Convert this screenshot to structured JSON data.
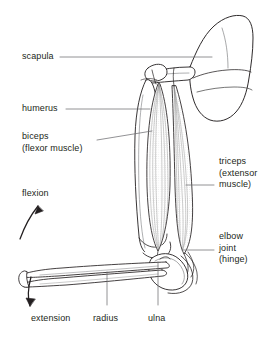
{
  "figure": {
    "background": "#ffffff",
    "ink": "#231f20",
    "leader_color": "#6d6e71"
  },
  "labels": {
    "scapula": {
      "text": "scapula",
      "x": 22,
      "y": 53
    },
    "humerus": {
      "text": "humerus",
      "x": 22,
      "y": 105
    },
    "biceps": {
      "line1": "biceps",
      "line2": "(flexor muscle)",
      "x": 22,
      "y": 135
    },
    "flexion": {
      "text": "flexion",
      "x": 22,
      "y": 191
    },
    "extension": {
      "text": "extension",
      "x": 31,
      "y": 316
    },
    "radius": {
      "text": "radius",
      "x": 94,
      "y": 316
    },
    "ulna": {
      "text": "ulna",
      "x": 149,
      "y": 316
    },
    "triceps": {
      "line1": "triceps",
      "line2": "(extensor",
      "line3": "muscle)",
      "x": 218,
      "y": 158
    },
    "elbow": {
      "line1": "elbow",
      "line2": "joint",
      "line3": "(hinge)",
      "x": 218,
      "y": 233
    }
  },
  "structures": [
    {
      "name": "scapula",
      "kind": "bone"
    },
    {
      "name": "humerus",
      "kind": "bone"
    },
    {
      "name": "radius",
      "kind": "bone"
    },
    {
      "name": "ulna",
      "kind": "bone"
    },
    {
      "name": "biceps",
      "kind": "muscle",
      "role": "flexor"
    },
    {
      "name": "triceps",
      "kind": "muscle",
      "role": "extensor"
    },
    {
      "name": "elbow-joint",
      "kind": "joint",
      "role": "hinge"
    }
  ],
  "motion_arrows": [
    {
      "name": "flexion-arrow",
      "direction": "up-right"
    },
    {
      "name": "extension-arrow",
      "direction": "down-left"
    }
  ]
}
